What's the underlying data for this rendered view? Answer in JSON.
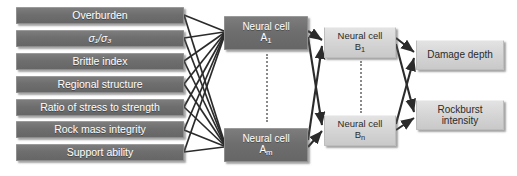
{
  "diagram": {
    "background_color": "#ffffff",
    "input_box_color": "#6e6e6e",
    "hidden_a_box_color": "#6e6e6e",
    "hidden_b_box_color": "#d5d5d5",
    "output_box_color": "#d5d5d5",
    "wire_color": "#2b2b2b"
  },
  "input_layer": {
    "items": [
      {
        "label": "Overburden"
      },
      {
        "label": "σ₁/σ₃",
        "stress_numerator": "σ₁",
        "stress_denominator": "σ₃"
      },
      {
        "label": "Brittle index"
      },
      {
        "label": "Regional structure"
      },
      {
        "label": "Ratio of stress to strength"
      },
      {
        "label": "Rock mass integrity"
      },
      {
        "label": "Support ability"
      }
    ]
  },
  "hidden_layer_a": {
    "cell_prefix": "Neural cell",
    "nodes": [
      {
        "name": "A",
        "index": "1"
      },
      {
        "name": "A",
        "index": "m"
      }
    ],
    "ellipsis": "vertical-dotted"
  },
  "hidden_layer_b": {
    "cell_prefix": "Neural cell",
    "nodes": [
      {
        "name": "B",
        "index": "1"
      },
      {
        "name": "B",
        "index": "n"
      }
    ],
    "ellipsis": "vertical-dotted"
  },
  "output_layer": {
    "items": [
      {
        "label": "Damage depth"
      },
      {
        "label": "Rockburst intensity",
        "line1": "Rockburst",
        "line2": "intensity"
      }
    ]
  }
}
